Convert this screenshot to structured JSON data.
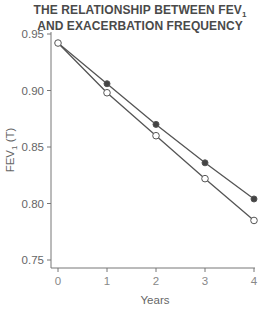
{
  "chart_data": {
    "type": "line",
    "title_lines": [
      "THE RELATIONSHIP BETWEEN FEV",
      "AND EXACERBATION FREQUENCY"
    ],
    "title_subscript": "1",
    "xlabel": "Years",
    "ylabel": "FEV1 (T)",
    "ylabel_parts": {
      "main": "FEV",
      "sub": "1",
      "rest": " (T)"
    },
    "x": [
      0,
      1,
      2,
      3,
      4
    ],
    "x_tick_labels": [
      "0",
      "1",
      "2",
      "3",
      "4"
    ],
    "y_tick_labels": [
      "0.95",
      "0.90",
      "0.85",
      "0.80",
      "0.75"
    ],
    "y_ticks": [
      0.95,
      0.9,
      0.85,
      0.8,
      0.75
    ],
    "ylim": [
      0.745,
      0.95
    ],
    "xlim": [
      0,
      4
    ],
    "grid": false,
    "legend": null,
    "series": [
      {
        "name": "Filled markers",
        "marker": "filled-circle",
        "values": [
          0.942,
          0.906,
          0.87,
          0.836,
          0.804
        ]
      },
      {
        "name": "Open markers",
        "marker": "open-circle",
        "values": [
          0.942,
          0.898,
          0.86,
          0.822,
          0.785
        ]
      }
    ],
    "colors": {
      "line": "#555555",
      "axis": "#777777",
      "filled_marker": "#444444",
      "open_marker_fill": "#ffffff"
    }
  }
}
